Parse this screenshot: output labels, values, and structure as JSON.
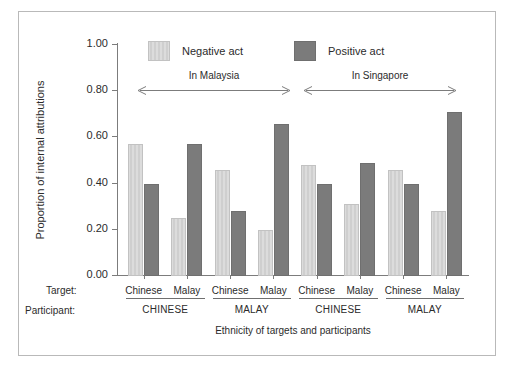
{
  "chart_data": {
    "type": "bar",
    "title": "",
    "xlabel": "Ethnicity of targets and participants",
    "ylabel": "Proportion of internal attributions",
    "ylim": [
      0.0,
      1.0
    ],
    "ytick_labels": [
      "0.00",
      "0.20",
      "0.40",
      "0.60",
      "0.80",
      "1.00"
    ],
    "ytick_values": [
      0.0,
      0.2,
      0.4,
      0.6,
      0.8,
      1.0
    ],
    "grid": false,
    "legend_position": "top",
    "legend": [
      "Negative act",
      "Positive act"
    ],
    "group_brackets": [
      "In Malaysia",
      "In Singapore"
    ],
    "row_headers": [
      "Target:",
      "Participant:"
    ],
    "participants": [
      "CHINESE",
      "MALAY",
      "CHINESE",
      "MALAY"
    ],
    "categories": [
      "Chinese",
      "Malay",
      "Chinese",
      "Malay",
      "Chinese",
      "Malay",
      "Chinese",
      "Malay"
    ],
    "series": [
      {
        "name": "Negative act",
        "color": "#cfcfcf",
        "values": [
          0.57,
          0.25,
          0.46,
          0.2,
          0.48,
          0.31,
          0.46,
          0.28
        ]
      },
      {
        "name": "Positive act",
        "color": "#7b7b7b",
        "values": [
          0.4,
          0.57,
          0.28,
          0.66,
          0.4,
          0.49,
          0.4,
          0.71
        ]
      }
    ]
  },
  "axis": {
    "y_title": "Proportion of internal attributions",
    "x_title": "Ethnicity of targets and participants",
    "ticks": [
      "1.00",
      "0.80",
      "0.60",
      "0.40",
      "0.20",
      "0.00"
    ]
  },
  "legend": {
    "negative_label": "Negative act",
    "positive_label": "Positive act"
  },
  "brackets": {
    "malaysia": "In Malaysia",
    "singapore": "In Singapore"
  },
  "rows": {
    "target_caption": "Target:",
    "participant_caption": "Participant:",
    "targets": [
      "Chinese",
      "Malay",
      "Chinese",
      "Malay",
      "Chinese",
      "Malay",
      "Chinese",
      "Malay"
    ],
    "participants": [
      "CHINESE",
      "MALAY",
      "CHINESE",
      "MALAY"
    ]
  },
  "colors": {
    "negative": "#cfcfcf",
    "positive": "#7b7b7b",
    "axis": "#7c7c7c",
    "frame": "#b9b9b9"
  }
}
